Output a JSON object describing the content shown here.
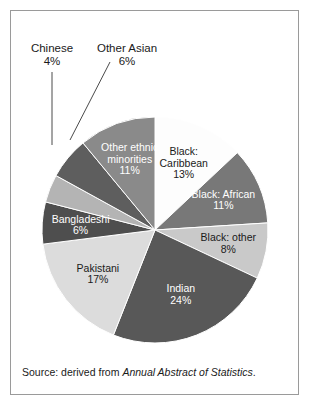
{
  "figure": {
    "background_color": "#ffffff",
    "frame_color": "#9a9a9a"
  },
  "caption": {
    "prefix": "Source: derived from ",
    "source_title": "Annual Abstract of Statistics",
    "suffix": "."
  },
  "chart_data": {
    "type": "pie",
    "title": "",
    "subtitle": "",
    "xlabel": "",
    "ylabel": "",
    "legend_position": "none",
    "grid": false,
    "total_percent": 100,
    "units": "percent",
    "categories": [
      "Black: Caribbean",
      "Black: African",
      "Black: other",
      "Indian",
      "Pakistani",
      "Bangladeshi",
      "Chinese",
      "Other Asian",
      "Other ethnic minorities"
    ],
    "values": [
      13,
      11,
      8,
      24,
      17,
      6,
      4,
      6,
      11
    ],
    "slices": [
      {
        "label": "Black: Caribbean",
        "value": 13,
        "value_text": "13%",
        "color": "#fdfdfd",
        "text_color": "#1a1a1a",
        "label_placement": "inside",
        "label_lines": [
          "Black:",
          "Caribbean",
          "13%"
        ]
      },
      {
        "label": "Black: African",
        "value": 11,
        "value_text": "11%",
        "color": "#787878",
        "text_color": "#ffffff",
        "label_placement": "inside",
        "label_lines": [
          "Black: African",
          "11%"
        ]
      },
      {
        "label": "Black: other",
        "value": 8,
        "value_text": "8%",
        "color": "#c9c9c9",
        "text_color": "#1a1a1a",
        "label_placement": "inside",
        "label_lines": [
          "Black: other",
          "8%"
        ]
      },
      {
        "label": "Indian",
        "value": 24,
        "value_text": "24%",
        "color": "#585858",
        "text_color": "#ffffff",
        "label_placement": "inside",
        "label_lines": [
          "Indian",
          "24%"
        ]
      },
      {
        "label": "Pakistani",
        "value": 17,
        "value_text": "17%",
        "color": "#dcdcdc",
        "text_color": "#1a1a1a",
        "label_placement": "inside",
        "label_lines": [
          "Pakistani",
          "17%"
        ]
      },
      {
        "label": "Bangladeshi",
        "value": 6,
        "value_text": "6%",
        "color": "#4e4e4e",
        "text_color": "#ffffff",
        "label_placement": "inside",
        "label_lines": [
          "Bangladeshi",
          "6%"
        ]
      },
      {
        "label": "Chinese",
        "value": 4,
        "value_text": "4%",
        "color": "#b4b4b4",
        "text_color": "#1a1a1a",
        "label_placement": "callout",
        "label_lines": [
          "Chinese",
          "4%"
        ]
      },
      {
        "label": "Other Asian",
        "value": 6,
        "value_text": "6%",
        "color": "#5e5e5e",
        "text_color": "#1a1a1a",
        "label_placement": "callout",
        "label_lines": [
          "Other Asian",
          "6%"
        ]
      },
      {
        "label": "Other ethnic minorities",
        "value": 11,
        "value_text": "11%",
        "color": "#8a8a8a",
        "text_color": "#ffffff",
        "label_placement": "inside",
        "label_lines": [
          "Other ethnic",
          "minorities",
          "11%"
        ]
      }
    ],
    "callouts": [
      {
        "label": "Chinese",
        "value_text": "4%",
        "text_x": 52,
        "text_y": 52,
        "leader": "M 52,72 L 52,145"
      },
      {
        "label": "Other Asian",
        "value_text": "6%",
        "text_x": 127,
        "text_y": 52,
        "leader": "M 110,62 L 70,140"
      }
    ],
    "geometry": {
      "center_x": 155,
      "center_y": 230,
      "radius": 113,
      "start_angle_deg": 0,
      "direction": "clockwise"
    }
  }
}
